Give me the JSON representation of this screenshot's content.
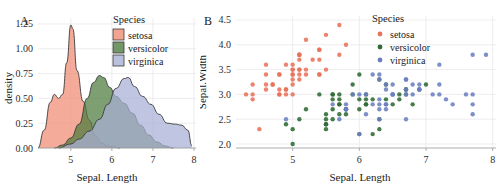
{
  "figure": {
    "background": "#ffffff",
    "grid_color": "#e9e9ec",
    "axis_color": "#9a9a9a"
  },
  "colors": {
    "setosa": "#F08B72",
    "versicolor": "#4B7A3C",
    "virginica": "#A7AFD6",
    "setosa_point": "#E8725A",
    "versicolor_point": "#2F6B32",
    "virginica_point": "#6B7FC0"
  },
  "panel_a": {
    "letter": "A",
    "legend": {
      "title": "Species",
      "items": [
        {
          "label": "setosa",
          "color": "#F08B72"
        },
        {
          "label": "versicolor",
          "color": "#4B7A3C"
        },
        {
          "label": "virginica",
          "color": "#A7AFD6"
        }
      ]
    },
    "chart_data": {
      "type": "area",
      "title": "",
      "xlabel": "Sepal. Length",
      "ylabel": "density",
      "xlim": [
        4.2,
        8.05
      ],
      "ylim": [
        0.0,
        1.31
      ],
      "xticks": [
        5,
        6,
        7,
        8
      ],
      "xtick_labels": [
        "5",
        "6",
        "7",
        "8"
      ],
      "yticks": [
        0.0,
        0.25,
        0.5,
        0.75,
        1.0,
        1.25
      ],
      "ytick_labels": [
        "0.00",
        "0.25",
        "0.50",
        "0.75",
        "1.00",
        "1.25"
      ],
      "grid": true,
      "legend_position": "top-right",
      "series": [
        {
          "name": "setosa",
          "color": "#F08B72",
          "x": [
            4.2,
            4.35,
            4.5,
            4.6,
            4.7,
            4.8,
            4.9,
            5.0,
            5.05,
            5.15,
            5.3,
            5.45,
            5.6,
            5.75,
            5.9,
            6.05,
            6.2
          ],
          "y": [
            0.0,
            0.18,
            0.46,
            0.54,
            0.5,
            0.54,
            0.86,
            1.24,
            1.2,
            0.78,
            0.47,
            0.28,
            0.12,
            0.05,
            0.02,
            0.01,
            0.0
          ]
        },
        {
          "name": "versicolor",
          "color": "#4B7A3C",
          "x": [
            4.6,
            4.8,
            5.0,
            5.2,
            5.4,
            5.55,
            5.7,
            5.8,
            5.95,
            6.1,
            6.3,
            6.5,
            6.7,
            6.9,
            7.1,
            7.3,
            7.5
          ],
          "y": [
            0.0,
            0.03,
            0.1,
            0.24,
            0.5,
            0.66,
            0.73,
            0.71,
            0.61,
            0.52,
            0.45,
            0.35,
            0.23,
            0.13,
            0.06,
            0.02,
            0.0
          ]
        },
        {
          "name": "virginica",
          "color": "#A7AFD6",
          "x": [
            4.7,
            5.0,
            5.2,
            5.45,
            5.7,
            5.9,
            6.1,
            6.3,
            6.4,
            6.55,
            6.75,
            6.95,
            7.15,
            7.35,
            7.55,
            7.7,
            7.85,
            7.95
          ],
          "y": [
            0.0,
            0.04,
            0.09,
            0.17,
            0.29,
            0.44,
            0.6,
            0.7,
            0.71,
            0.62,
            0.52,
            0.44,
            0.34,
            0.25,
            0.24,
            0.23,
            0.18,
            0.02
          ]
        }
      ]
    }
  },
  "panel_b": {
    "letter": "B",
    "legend": {
      "title": "Species",
      "items": [
        {
          "label": "setosa",
          "color": "#E8725A"
        },
        {
          "label": "versicolor",
          "color": "#2F6B32"
        },
        {
          "label": "virginica",
          "color": "#6B7FC0"
        }
      ]
    },
    "chart_data": {
      "type": "scatter",
      "title": "",
      "xlabel": "Sepal. Length",
      "ylabel": "Sepal.Width",
      "xlim": [
        4.15,
        8.05
      ],
      "ylim": [
        1.92,
        4.58
      ],
      "xticks": [
        5,
        6,
        7,
        8
      ],
      "xtick_labels": [
        "5",
        "6",
        "7",
        "8"
      ],
      "yticks": [
        2.0,
        2.5,
        3.0,
        3.5,
        4.0,
        4.5
      ],
      "ytick_labels": [
        "2.0",
        "2.5",
        "3.0",
        "3.5",
        "4.0",
        "4.5"
      ],
      "grid": true,
      "legend_position": "top-right",
      "series": [
        {
          "name": "setosa",
          "color": "#E8725A",
          "points": [
            [
              5.1,
              3.5
            ],
            [
              4.9,
              3.0
            ],
            [
              4.7,
              3.2
            ],
            [
              4.6,
              3.1
            ],
            [
              5.0,
              3.6
            ],
            [
              5.4,
              3.9
            ],
            [
              4.6,
              3.4
            ],
            [
              5.0,
              3.4
            ],
            [
              4.4,
              2.9
            ],
            [
              4.9,
              3.1
            ],
            [
              5.4,
              3.7
            ],
            [
              4.8,
              3.4
            ],
            [
              4.8,
              3.0
            ],
            [
              4.3,
              3.0
            ],
            [
              5.8,
              4.0
            ],
            [
              5.7,
              4.4
            ],
            [
              5.4,
              3.9
            ],
            [
              5.1,
              3.5
            ],
            [
              5.7,
              3.8
            ],
            [
              5.1,
              3.8
            ],
            [
              5.4,
              3.4
            ],
            [
              5.1,
              3.7
            ],
            [
              4.6,
              3.6
            ],
            [
              5.1,
              3.3
            ],
            [
              4.8,
              3.4
            ],
            [
              5.0,
              3.0
            ],
            [
              5.0,
              3.4
            ],
            [
              5.2,
              3.5
            ],
            [
              5.2,
              3.4
            ],
            [
              4.7,
              3.2
            ],
            [
              4.8,
              3.1
            ],
            [
              5.4,
              3.4
            ],
            [
              5.2,
              4.1
            ],
            [
              5.5,
              4.2
            ],
            [
              4.9,
              3.1
            ],
            [
              5.0,
              3.2
            ],
            [
              5.5,
              3.5
            ],
            [
              4.9,
              3.6
            ],
            [
              4.4,
              3.0
            ],
            [
              5.1,
              3.4
            ],
            [
              5.0,
              3.5
            ],
            [
              4.5,
              2.3
            ],
            [
              4.4,
              3.2
            ],
            [
              5.0,
              3.5
            ],
            [
              5.1,
              3.8
            ],
            [
              4.8,
              3.0
            ],
            [
              5.1,
              3.8
            ],
            [
              4.6,
              3.2
            ],
            [
              5.3,
              3.7
            ],
            [
              5.0,
              3.3
            ]
          ]
        },
        {
          "name": "versicolor",
          "color": "#2F6B32",
          "points": [
            [
              7.0,
              3.2
            ],
            [
              6.4,
              3.2
            ],
            [
              6.9,
              3.1
            ],
            [
              5.5,
              2.3
            ],
            [
              6.5,
              2.8
            ],
            [
              5.7,
              2.8
            ],
            [
              6.3,
              3.3
            ],
            [
              4.9,
              2.4
            ],
            [
              6.6,
              2.9
            ],
            [
              5.2,
              2.7
            ],
            [
              5.0,
              2.0
            ],
            [
              5.9,
              3.0
            ],
            [
              6.0,
              2.2
            ],
            [
              6.1,
              2.9
            ],
            [
              5.6,
              2.9
            ],
            [
              6.7,
              3.1
            ],
            [
              5.6,
              3.0
            ],
            [
              5.8,
              2.7
            ],
            [
              6.2,
              2.2
            ],
            [
              5.6,
              2.5
            ],
            [
              5.9,
              3.2
            ],
            [
              6.1,
              2.8
            ],
            [
              6.3,
              2.5
            ],
            [
              6.1,
              2.8
            ],
            [
              6.4,
              2.9
            ],
            [
              6.6,
              3.0
            ],
            [
              6.8,
              2.8
            ],
            [
              6.7,
              3.0
            ],
            [
              6.0,
              2.9
            ],
            [
              5.7,
              2.6
            ],
            [
              5.5,
              2.4
            ],
            [
              5.5,
              2.4
            ],
            [
              5.8,
              2.7
            ],
            [
              6.0,
              2.7
            ],
            [
              5.4,
              3.0
            ],
            [
              6.0,
              3.4
            ],
            [
              6.7,
              3.1
            ],
            [
              6.3,
              2.3
            ],
            [
              5.6,
              3.0
            ],
            [
              5.5,
              2.5
            ],
            [
              5.5,
              2.6
            ],
            [
              6.1,
              3.0
            ],
            [
              5.8,
              2.6
            ],
            [
              5.0,
              2.3
            ],
            [
              5.6,
              2.7
            ],
            [
              5.7,
              3.0
            ],
            [
              5.7,
              2.9
            ],
            [
              6.2,
              2.9
            ],
            [
              5.1,
              2.5
            ],
            [
              5.7,
              2.8
            ]
          ]
        },
        {
          "name": "virginica",
          "color": "#6B7FC0",
          "points": [
            [
              6.3,
              3.3
            ],
            [
              5.8,
              2.7
            ],
            [
              7.1,
              3.0
            ],
            [
              6.3,
              2.9
            ],
            [
              6.5,
              3.0
            ],
            [
              7.6,
              3.0
            ],
            [
              4.9,
              2.5
            ],
            [
              7.3,
              2.9
            ],
            [
              6.7,
              2.5
            ],
            [
              7.2,
              3.6
            ],
            [
              6.5,
              3.2
            ],
            [
              6.4,
              2.7
            ],
            [
              6.8,
              3.0
            ],
            [
              5.7,
              2.5
            ],
            [
              5.8,
              2.8
            ],
            [
              6.4,
              3.2
            ],
            [
              6.5,
              3.0
            ],
            [
              7.7,
              3.8
            ],
            [
              7.7,
              2.6
            ],
            [
              6.0,
              2.2
            ],
            [
              6.9,
              3.2
            ],
            [
              5.6,
              2.8
            ],
            [
              7.7,
              2.8
            ],
            [
              6.3,
              2.7
            ],
            [
              6.7,
              3.3
            ],
            [
              7.2,
              3.2
            ],
            [
              6.2,
              2.8
            ],
            [
              6.1,
              3.0
            ],
            [
              6.4,
              2.8
            ],
            [
              7.2,
              3.0
            ],
            [
              7.4,
              2.8
            ],
            [
              7.9,
              3.8
            ],
            [
              6.4,
              2.8
            ],
            [
              6.3,
              2.8
            ],
            [
              6.1,
              2.6
            ],
            [
              7.7,
              3.0
            ],
            [
              6.3,
              3.4
            ],
            [
              6.4,
              3.1
            ],
            [
              6.0,
              3.0
            ],
            [
              6.9,
              3.1
            ],
            [
              6.7,
              3.1
            ],
            [
              6.9,
              3.1
            ],
            [
              5.8,
              2.7
            ],
            [
              6.8,
              3.2
            ],
            [
              6.7,
              3.3
            ],
            [
              6.7,
              3.0
            ],
            [
              6.3,
              2.5
            ],
            [
              6.5,
              3.0
            ],
            [
              6.2,
              3.4
            ],
            [
              5.9,
              3.0
            ]
          ]
        }
      ]
    }
  }
}
